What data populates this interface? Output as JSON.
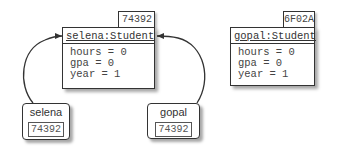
{
  "objects": [
    {
      "address": "74392",
      "title": "selena:Student",
      "fields": [
        "hours = 0",
        "gpa = 0",
        "year = 1"
      ]
    },
    {
      "address": "6F02A",
      "title": "gopal:Student",
      "fields": [
        "hours = 0",
        "gpa = 0",
        "year = 1"
      ]
    }
  ],
  "variables": [
    {
      "name": "selena",
      "value": "74392"
    },
    {
      "name": "gopal",
      "value": "74392"
    }
  ]
}
